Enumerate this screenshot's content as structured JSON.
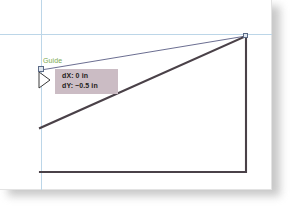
{
  "app": {
    "canvas_name": "drawing-canvas",
    "background_color": "#ffffff",
    "paper_color": "#ffffff",
    "shadow_color": "#9b9b9b"
  },
  "guides": {
    "color": "#bcd6e8",
    "label": "Guide",
    "label_color": "#7aa84f",
    "vertical": {
      "x": 41
    },
    "horizontal": {
      "y": 34
    }
  },
  "tooltip": {
    "name": "measurement-tooltip",
    "background_color": "#cbbcc4",
    "text_color": "#241c20",
    "line1": "dX: 0 in",
    "line2": "dY: −0.5 in"
  },
  "geometry": {
    "edge_color": "#4a4148",
    "inference_color": "#5a5d85",
    "shape_points": "40,128 246,36 246,172 40,172",
    "inference_line": {
      "x1": 41,
      "y1": 70,
      "x2": 246,
      "y2": 36
    },
    "handles": [
      {
        "name": "vertex-handle-top-right",
        "x": 243,
        "y": 33
      },
      {
        "name": "vertex-handle-guide-origin",
        "x": 38,
        "y": 67
      }
    ]
  },
  "cursor": {
    "name": "arrow-cursor",
    "x": 39,
    "y": 72,
    "fill": "#ffffff",
    "stroke": "#3a3a3a"
  }
}
